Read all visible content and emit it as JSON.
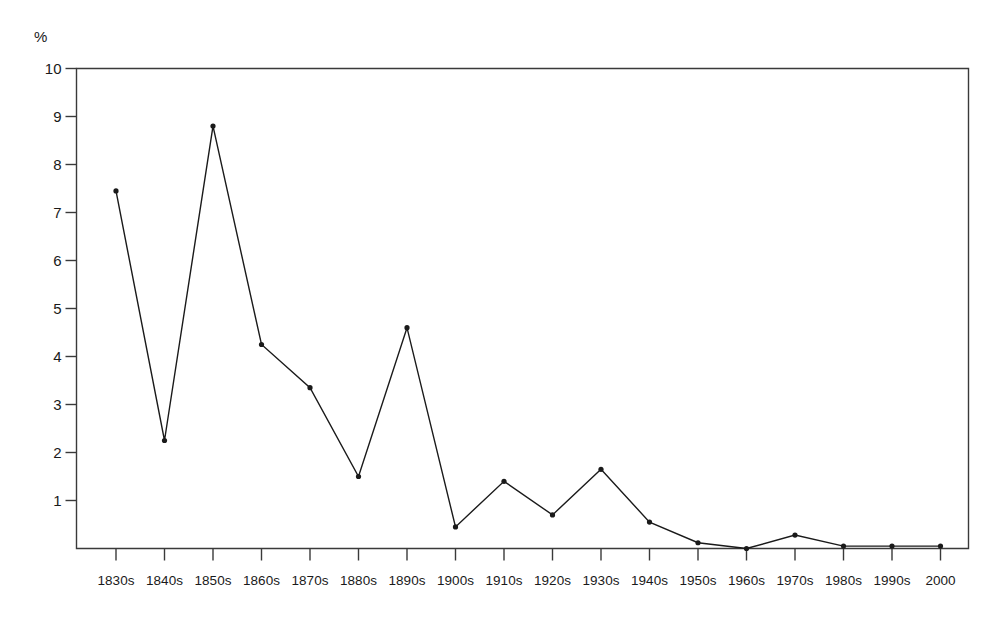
{
  "chart_data": {
    "type": "line",
    "title": "",
    "subtitle": "",
    "xlabel": "",
    "ylabel": "%",
    "unit_label": "%",
    "categories": [
      "1830s",
      "1840s",
      "1850s",
      "1860s",
      "1870s",
      "1880s",
      "1890s",
      "1900s",
      "1910s",
      "1920s",
      "1930s",
      "1940s",
      "1950s",
      "1960s",
      "1970s",
      "1980s",
      "1990s",
      "2000"
    ],
    "values": [
      7.45,
      2.25,
      8.8,
      4.25,
      3.35,
      1.5,
      4.6,
      0.45,
      1.4,
      0.7,
      1.65,
      0.55,
      0.12,
      0.0,
      0.28,
      0.05,
      0.05,
      0.05
    ],
    "series": [
      {
        "name": "",
        "values": [
          7.45,
          2.25,
          8.8,
          4.25,
          3.35,
          1.5,
          4.6,
          0.45,
          1.4,
          0.7,
          1.65,
          0.55,
          0.12,
          0.0,
          0.28,
          0.05,
          0.05,
          0.05
        ]
      }
    ],
    "ylim": [
      0,
      10
    ],
    "ytick_labels": [
      "10",
      "9",
      "8",
      "7",
      "6",
      "5",
      "4",
      "3",
      "2",
      "1"
    ],
    "ytick_values": [
      10,
      9,
      8,
      7,
      6,
      5,
      4,
      3,
      2,
      1
    ],
    "grid": false,
    "legend": "none",
    "line_color": "#1a1a1a",
    "marker_color": "#1a1a1a",
    "axis_color": "#3a3a3a",
    "background_color": "#ffffff"
  }
}
